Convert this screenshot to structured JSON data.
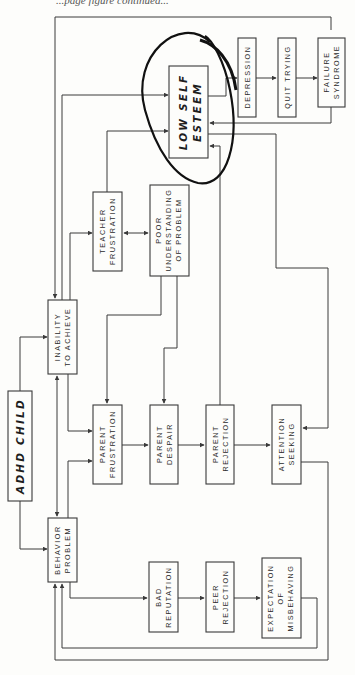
{
  "header": {
    "text": "...page figure continued..."
  },
  "diagram": {
    "orientation": "rotated-90-ccw",
    "highlight": "Low Self Esteem (circled)",
    "nodes": {
      "adhd_child": {
        "lines": [
          "ADHD CHILD"
        ]
      },
      "inability": {
        "lines": [
          "INABILITY",
          "TO ACHIEVE"
        ]
      },
      "behavior": {
        "lines": [
          "BEHAVIOR",
          "PROBLEM"
        ]
      },
      "teacher": {
        "lines": [
          "TEACHER",
          "FRUSTRATION"
        ]
      },
      "poor_understanding": {
        "lines": [
          "POOR",
          "UNDERSTANDING",
          "OF PROBLEM"
        ]
      },
      "low_self_esteem": {
        "lines": [
          "LOW SELF",
          "ESTEEM"
        ]
      },
      "depression": {
        "lines": [
          "DEPRESSION"
        ]
      },
      "quit_trying": {
        "lines": [
          "QUIT TRYING"
        ]
      },
      "failure": {
        "lines": [
          "FAILURE",
          "SYNDROME"
        ]
      },
      "parent_frustration": {
        "lines": [
          "PARENT",
          "FRUSTRATION"
        ]
      },
      "parent_despair": {
        "lines": [
          "PARENT",
          "DESPAIR"
        ]
      },
      "parent_rejection": {
        "lines": [
          "PARENT",
          "REJECTION"
        ]
      },
      "attention_seeking": {
        "lines": [
          "ATTENTION",
          "SEEKING"
        ]
      },
      "bad_reputation": {
        "lines": [
          "BAD",
          "REPUTATION"
        ]
      },
      "peer_rejection": {
        "lines": [
          "PEER",
          "REJECTION"
        ]
      },
      "expectation": {
        "lines": [
          "EXPECTATION",
          "OF",
          "MISBEHAVING"
        ]
      }
    },
    "edges": [
      [
        "adhd_child",
        "inability"
      ],
      [
        "adhd_child",
        "behavior"
      ],
      [
        "inability",
        "behavior",
        "bidirectional"
      ],
      [
        "inability",
        "parent_frustration"
      ],
      [
        "behavior",
        "parent_frustration"
      ],
      [
        "inability",
        "teacher"
      ],
      [
        "inability",
        "low_self_esteem"
      ],
      [
        "teacher",
        "poor_understanding",
        "bidirectional"
      ],
      [
        "teacher",
        "low_self_esteem"
      ],
      [
        "poor_understanding",
        "parent_frustration"
      ],
      [
        "poor_understanding",
        "parent_despair"
      ],
      [
        "parent_frustration",
        "parent_despair"
      ],
      [
        "parent_despair",
        "parent_rejection"
      ],
      [
        "parent_rejection",
        "attention_seeking"
      ],
      [
        "parent_rejection",
        "low_self_esteem"
      ],
      [
        "low_self_esteem",
        "depression"
      ],
      [
        "low_self_esteem",
        "attention_seeking"
      ],
      [
        "depression",
        "quit_trying"
      ],
      [
        "quit_trying",
        "failure"
      ],
      [
        "failure",
        "low_self_esteem"
      ],
      [
        "failure",
        "inability"
      ],
      [
        "behavior",
        "bad_reputation"
      ],
      [
        "bad_reputation",
        "peer_rejection"
      ],
      [
        "peer_rejection",
        "expectation"
      ],
      [
        "expectation",
        "behavior"
      ],
      [
        "attention_seeking",
        "behavior"
      ]
    ]
  }
}
